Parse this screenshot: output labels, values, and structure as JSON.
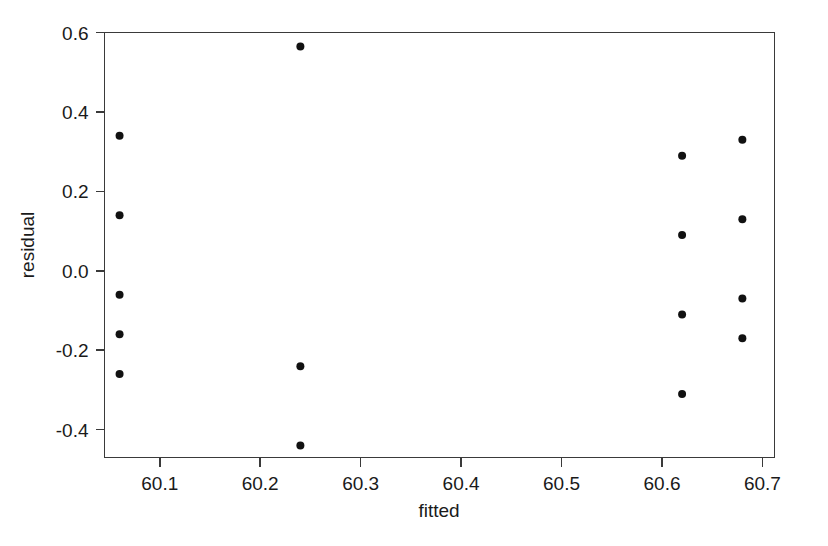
{
  "chart_data": {
    "type": "scatter",
    "title": "",
    "xlabel": "fitted",
    "ylabel": "residual",
    "xlim": [
      60.045,
      60.712
    ],
    "ylim": [
      -0.47,
      0.6
    ],
    "grid": false,
    "legend": null,
    "xticks": [
      60.1,
      60.2,
      60.3,
      60.4,
      60.5,
      60.6,
      60.7
    ],
    "xtick_labels": [
      "60.1",
      "60.2",
      "60.3",
      "60.4",
      "60.5",
      "60.6",
      "60.7"
    ],
    "yticks": [
      -0.4,
      -0.2,
      0.0,
      0.2,
      0.4,
      0.6
    ],
    "ytick_labels": [
      "-0.4",
      "-0.2",
      "0.0",
      "0.2",
      "0.4",
      "0.6"
    ],
    "marker": "filled-circle",
    "marker_color": "#111111",
    "marker_size": 4,
    "points": [
      {
        "x": 60.06,
        "y": 0.34
      },
      {
        "x": 60.06,
        "y": 0.14
      },
      {
        "x": 60.06,
        "y": -0.06
      },
      {
        "x": 60.06,
        "y": -0.16
      },
      {
        "x": 60.06,
        "y": -0.26
      },
      {
        "x": 60.24,
        "y": 0.565
      },
      {
        "x": 60.24,
        "y": -0.24
      },
      {
        "x": 60.24,
        "y": -0.44
      },
      {
        "x": 60.62,
        "y": 0.29
      },
      {
        "x": 60.62,
        "y": 0.09
      },
      {
        "x": 60.62,
        "y": -0.11
      },
      {
        "x": 60.62,
        "y": -0.31
      },
      {
        "x": 60.68,
        "y": 0.33
      },
      {
        "x": 60.68,
        "y": 0.13
      },
      {
        "x": 60.68,
        "y": -0.07
      },
      {
        "x": 60.68,
        "y": -0.17
      }
    ]
  },
  "axes": {
    "x_title": "fitted",
    "y_title": "residual"
  }
}
